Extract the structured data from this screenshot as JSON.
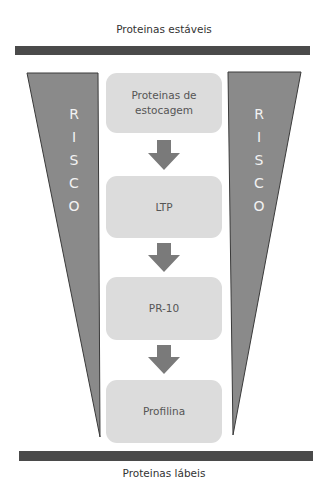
{
  "diagram": {
    "top_label": "Proteinas estáveis",
    "bottom_label": "Proteinas lábeis",
    "side_label_left": [
      "R",
      "I",
      "S",
      "C",
      "O"
    ],
    "side_label_right": [
      "R",
      "I",
      "S",
      "C",
      "O"
    ],
    "boxes": [
      {
        "label": "Proteinas de estocagem"
      },
      {
        "label": "LTP"
      },
      {
        "label": "PR-10"
      },
      {
        "label": "Profilina"
      }
    ],
    "colors": {
      "bar": "#4a4a4a",
      "trapezoid": "#8a8a8a",
      "box": "#dcdcdc",
      "arrow": "#7a7a7a"
    }
  }
}
